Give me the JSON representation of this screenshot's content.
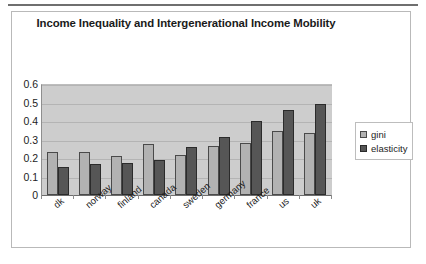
{
  "chart_data": {
    "type": "bar",
    "title": "Income Inequality and Intergenerational Income Mobility",
    "xlabel": "",
    "ylabel": "",
    "ylim": [
      0,
      0.6
    ],
    "yticks": [
      "0",
      "0.1",
      "0.2",
      "0.3",
      "0.4",
      "0.5",
      "0.6"
    ],
    "ytick_values": [
      0,
      0.1,
      0.2,
      0.3,
      0.4,
      0.5,
      0.6
    ],
    "grid": true,
    "legend_position": "right",
    "categories": [
      "dk",
      "norway",
      "finland",
      "canada",
      "sweden",
      "germany",
      "france",
      "us",
      "uk"
    ],
    "series": [
      {
        "name": "gini",
        "color": "#b2b2b2",
        "values": [
          0.23,
          0.235,
          0.21,
          0.275,
          0.215,
          0.265,
          0.28,
          0.345,
          0.335
        ]
      },
      {
        "name": "elasticity",
        "color": "#565656",
        "values": [
          0.15,
          0.165,
          0.175,
          0.19,
          0.26,
          0.315,
          0.4,
          0.46,
          0.49
        ]
      }
    ]
  },
  "legend": {
    "entries": [
      {
        "label": "gini",
        "swatch": "gini"
      },
      {
        "label": "elasticity",
        "swatch": "elasticity"
      }
    ]
  },
  "colors": {
    "plot_background": "#cdcdcd",
    "gridline": "#b4b4b4",
    "axis": "#6d6d6d",
    "frame_border": "#b9b9b9",
    "rule": "#6f6f6f",
    "gini": "#b2b2b2",
    "elasticity": "#565656"
  }
}
